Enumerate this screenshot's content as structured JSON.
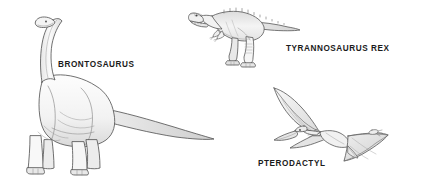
{
  "poster": {
    "width": 432,
    "height": 188,
    "background_color": "#ffffff",
    "outline_color": "#555555",
    "fill_light": "#fbfbfb",
    "fill_shade": "#e3e3e3",
    "label_color": "#1b1b1b"
  },
  "specimens": [
    {
      "id": "brontosaurus",
      "label": "BRONTOSAURUS",
      "icon_name": "brontosaurus-illustration",
      "label_position": {
        "x": 58,
        "y": 61
      },
      "figure_position": {
        "x": 8,
        "y": 16
      }
    },
    {
      "id": "tyrannosaurus",
      "label": "TYRANNOSAURUS REX",
      "icon_name": "tyrannosaurus-rex-illustration",
      "label_position": {
        "x": 286,
        "y": 45
      },
      "figure_position": {
        "x": 188,
        "y": 2
      }
    },
    {
      "id": "pterodactyl",
      "label": "PTERODACTYL",
      "icon_name": "pterodactyl-illustration",
      "label_position": {
        "x": 258,
        "y": 160
      },
      "figure_position": {
        "x": 252,
        "y": 86
      }
    }
  ]
}
